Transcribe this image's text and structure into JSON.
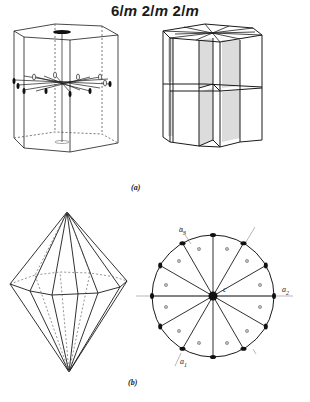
{
  "title": {
    "parts": [
      "6/",
      "m",
      " 2/",
      "m",
      " 2/",
      "m"
    ],
    "full": "6/m 2/m 2/m"
  },
  "panels": [
    {
      "id": "a",
      "label": "(a)",
      "description": "Hexagonal prism showing symmetry elements: 6-fold axis, 2-fold axes, mirror planes; and prism with hatched mirror planes"
    },
    {
      "id": "b",
      "label": "(b)",
      "description": "Dihexagonal dipyramid and stereographic projection"
    }
  ],
  "stereogram": {
    "axis_labels": {
      "a1": "a",
      "a1_sub": "1",
      "a2": "a",
      "a2_sub": "2",
      "a3": "a",
      "a3_sub": "3",
      "c": "c"
    },
    "poles_count": 12,
    "face_poles_count": 12
  },
  "colors": {
    "line": "#1a1a1a",
    "dashed": "#555555",
    "hatch": "#777777",
    "background": "#ffffff"
  }
}
